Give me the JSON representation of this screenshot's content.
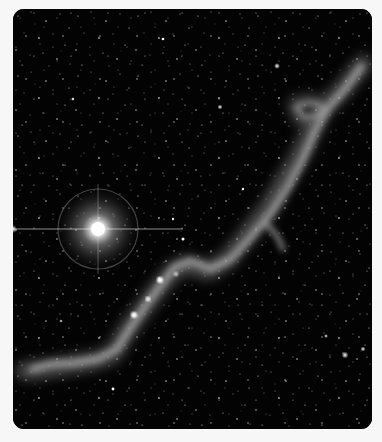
{
  "image": {
    "subject": "astronomical photograph of a dark nebula filament with a bright star",
    "background_color": "#030303",
    "page_background": "#f7f7f7",
    "bright_star": {
      "x": 85,
      "y": 220,
      "halo_radius": 40
    },
    "nebula_path_color": "#bdbdbd"
  }
}
